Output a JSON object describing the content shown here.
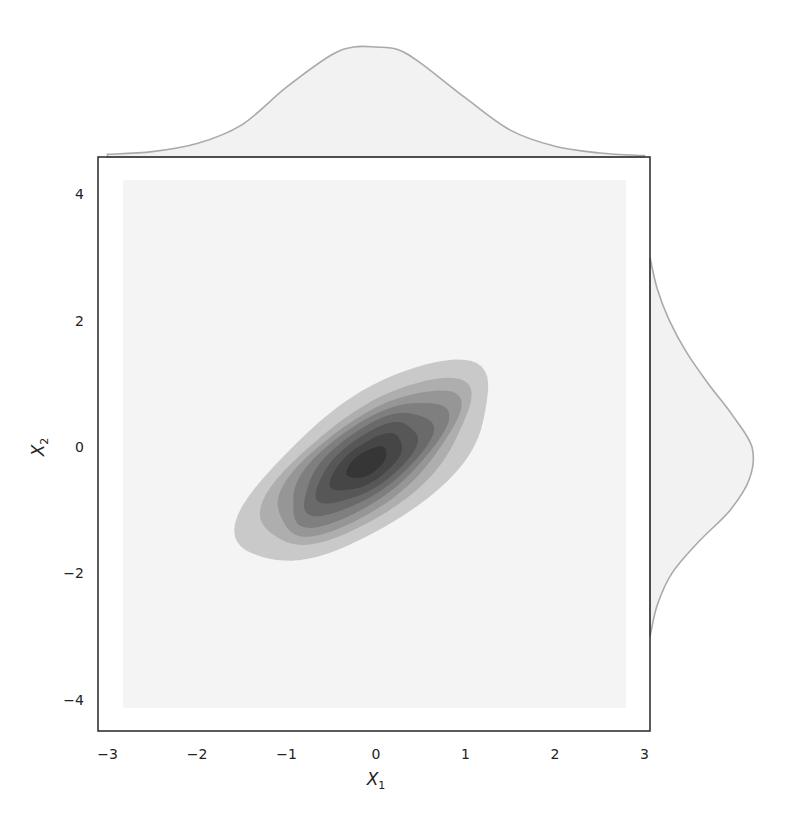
{
  "chart_data": {
    "type": "jointplot-kde",
    "title": "",
    "xlabel": "X",
    "xlabel_sub": "1",
    "ylabel": "X",
    "ylabel_sub": "2",
    "xlim": [
      -3.1,
      3.05
    ],
    "ylim": [
      -4.5,
      4.5
    ],
    "xticks": [
      -3,
      -2,
      -1,
      0,
      1,
      2,
      3
    ],
    "xtick_labels": [
      "−3",
      "−2",
      "−1",
      "0",
      "1",
      "2",
      "3"
    ],
    "yticks": [
      4,
      2,
      0,
      -2,
      -4
    ],
    "ytick_labels": [
      "4",
      "2",
      "0",
      "−2",
      "−4"
    ],
    "grid": false,
    "legend": null,
    "joint": {
      "kind": "filled-contour (bivariate KDE)",
      "colormap": "greys",
      "peak": {
        "x": -0.1,
        "y": -0.25
      },
      "correlation_angle_deg": 50,
      "levels": [
        {
          "level": 1,
          "rx": 1.95,
          "ry": 0.85,
          "color": "#c9c9c9"
        },
        {
          "level": 2,
          "rx": 1.62,
          "ry": 0.68,
          "color": "#aeaeae"
        },
        {
          "level": 3,
          "rx": 1.42,
          "ry": 0.58,
          "color": "#969696"
        },
        {
          "level": 4,
          "rx": 1.22,
          "ry": 0.5,
          "color": "#7f7f7f"
        },
        {
          "level": 5,
          "rx": 1.0,
          "ry": 0.42,
          "color": "#6a6a6a"
        },
        {
          "level": 6,
          "rx": 0.78,
          "ry": 0.34,
          "color": "#575757"
        },
        {
          "level": 7,
          "rx": 0.55,
          "ry": 0.25,
          "color": "#464646"
        },
        {
          "level": 8,
          "rx": 0.3,
          "ry": 0.15,
          "color": "#363636"
        }
      ]
    },
    "marginal_x": {
      "kind": "kde",
      "x": [
        -3.0,
        -2.5,
        -2.0,
        -1.5,
        -1.0,
        -0.5,
        -0.25,
        0.0,
        0.25,
        0.5,
        1.0,
        1.5,
        2.0,
        2.5,
        3.0
      ],
      "density": [
        0.01,
        0.02,
        0.05,
        0.12,
        0.26,
        0.38,
        0.41,
        0.41,
        0.4,
        0.35,
        0.22,
        0.1,
        0.04,
        0.015,
        0.005
      ]
    },
    "marginal_y": {
      "kind": "kde",
      "y": [
        -3.0,
        -2.5,
        -2.0,
        -1.5,
        -1.0,
        -0.5,
        0.0,
        0.5,
        1.0,
        1.5,
        2.0,
        2.5,
        3.0
      ],
      "density": [
        0.0,
        0.03,
        0.09,
        0.2,
        0.33,
        0.41,
        0.42,
        0.34,
        0.24,
        0.15,
        0.08,
        0.03,
        0.0
      ]
    },
    "colors": {
      "frame": "#333333",
      "marginal_fill": "#f2f2f2",
      "marginal_line": "#aaaaaa",
      "plot_background_box": "#f4f4f4"
    }
  }
}
